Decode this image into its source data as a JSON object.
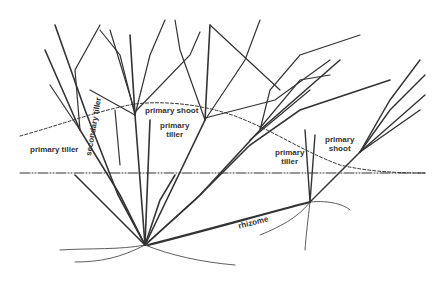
{
  "diagram": {
    "labels": {
      "primary_shoot_left": "primary shoot",
      "primary_tiller_left": "primary tiller",
      "secondary_tiller": "secondary tiller",
      "primary_tiller_center_l1": "primary",
      "primary_tiller_center_l2": "tiller",
      "primary_tiller_right_l1": "primary",
      "primary_tiller_right_l2": "tiller",
      "primary_shoot_right_l1": "primary",
      "primary_shoot_right_l2": "shoot",
      "rhizome": "rhizome"
    },
    "colors": {
      "ink": "#333333",
      "leaf_fill": "#bdbdbd",
      "background": "#ffffff"
    }
  }
}
